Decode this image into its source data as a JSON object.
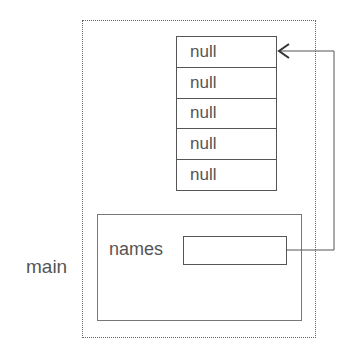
{
  "diagram": {
    "frame_label": "main",
    "variable": {
      "name": "names",
      "value": ""
    },
    "array": {
      "cells": [
        "null",
        "null",
        "null",
        "null",
        "null"
      ]
    },
    "reference_arrow": {
      "from": "names",
      "to": "array[0]"
    }
  },
  "colors": {
    "line": "#555555",
    "text": "#555555",
    "background": "#ffffff"
  }
}
